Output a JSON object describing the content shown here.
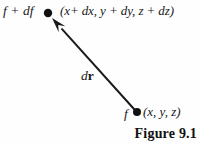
{
  "figure": {
    "caption": "Figure 9.1",
    "background_color": "#fefefe",
    "ink_color": "#181818"
  },
  "labels": {
    "displaced_scalar": "f + df",
    "displaced_coords": "(x+ dx, y + dy, z + dz)",
    "base_scalar": "f",
    "base_coords": "(x, y, z)",
    "vector_prefix": "d",
    "vector_symbol": "r"
  },
  "geometry": {
    "base_point": {
      "x": 137,
      "y": 112,
      "radius": 4.0
    },
    "displaced_point": {
      "x": 48,
      "y": 13,
      "radius": 4.2
    },
    "arrow_from": {
      "x": 134,
      "y": 109
    },
    "arrow_to": {
      "x": 52,
      "y": 18
    },
    "stroke_width": 2.0,
    "arrowhead_length": 15,
    "arrowhead_width": 9
  }
}
